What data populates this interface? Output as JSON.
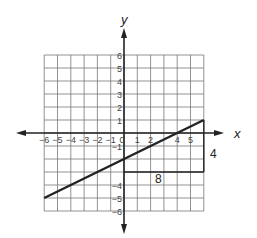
{
  "graph": {
    "x_axis_label": "x",
    "y_axis_label": "y",
    "x_range": [
      -6,
      6
    ],
    "y_range": [
      -6,
      6
    ],
    "x_tick_labels": [
      "-6",
      "-5",
      "-4",
      "-3",
      "-2",
      "-1",
      "0",
      "1",
      "2",
      "4",
      "5"
    ],
    "y_tick_labels": [
      "6",
      "5",
      "4",
      "3",
      "2",
      "1",
      "-1",
      "-4",
      "-5",
      "-6"
    ],
    "line": {
      "start": [
        -6,
        -5
      ],
      "end": [
        6,
        1
      ],
      "slope": 0.5,
      "y_intercept": -2
    },
    "slope_triangle": {
      "horizontal": {
        "from": [
          0,
          -3
        ],
        "to": [
          6,
          -3
        ],
        "label": "8"
      },
      "vertical": {
        "from": [
          6,
          -3
        ],
        "to": [
          6,
          1
        ],
        "label": "4"
      }
    }
  }
}
